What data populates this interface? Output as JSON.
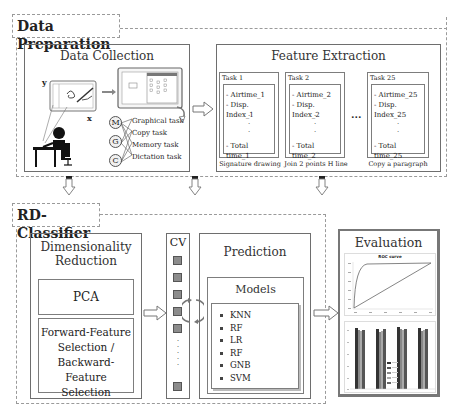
{
  "data_preparation": {
    "label": "Data Preparation",
    "data_collection": {
      "title": "Data Collection",
      "axis_x": "x",
      "axis_y": "y",
      "letters": [
        "M",
        "G",
        "C"
      ],
      "tasks": [
        "Graphical task",
        "Copy task",
        "Memory task",
        "Dictation task"
      ]
    },
    "feature_extraction": {
      "title": "Feature Extraction",
      "ellipsis": "...",
      "tasks": [
        {
          "name": "Task 1",
          "lines": [
            "- Airtime_1",
            "- Disp. Index_1"
          ],
          "last": "- Total time_1",
          "caption": "Signature drawing"
        },
        {
          "name": "Task 2",
          "lines": [
            "- Airtime_2",
            "- Disp. Index_2"
          ],
          "last": "- Total time_2",
          "caption": "Join 2 points H line"
        },
        {
          "name": "Task 25",
          "lines": [
            "- Airtime_25",
            "- Disp. Index_25"
          ],
          "last": "- Total time_25",
          "caption": "Copy a paragraph"
        }
      ]
    }
  },
  "rd_classifier": {
    "label": "RD-Classifier",
    "dimensionality_reduction": {
      "title_line1": "Dimensionality",
      "title_line2": "Reduction",
      "pca": "PCA",
      "selection_lines": [
        "Forward-Feature",
        "Selection /",
        "Backward-Feature",
        "Selection"
      ]
    },
    "cv": {
      "label": "CV",
      "vdots": "⋮"
    },
    "prediction": {
      "title": "Prediction",
      "models_title": "Models",
      "models": [
        "KNN",
        "RF",
        "LR",
        "RF",
        "GNB",
        "SVM"
      ]
    }
  },
  "evaluation": {
    "title": "Evaluation",
    "roc_title": "ROC curve"
  },
  "colors": {
    "border": "#7d7d7d",
    "dashed": "#9a9a9a",
    "cv_cell": "#8c8c8c",
    "bar_dark": "#3a3a3a",
    "bar_light": "#9a9a9a"
  }
}
